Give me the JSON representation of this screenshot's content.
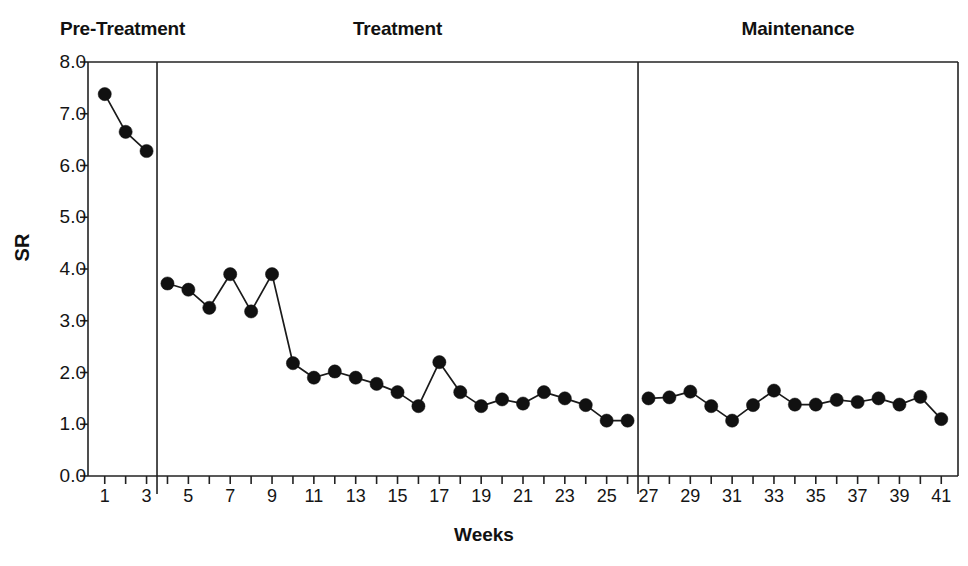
{
  "chart_data": {
    "type": "line",
    "title": "",
    "xlabel": "Weeks",
    "ylabel": "SR",
    "xlim": [
      0.2,
      41.8
    ],
    "ylim": [
      0.0,
      8.0
    ],
    "grid": false,
    "legend": null,
    "marker": "filled-circle",
    "series": [
      {
        "name": "SR",
        "x": [
          1,
          2,
          3,
          4,
          5,
          6,
          7,
          8,
          9,
          10,
          11,
          12,
          13,
          14,
          15,
          16,
          17,
          18,
          19,
          20,
          21,
          22,
          23,
          24,
          25,
          26,
          27,
          28,
          29,
          30,
          31,
          32,
          33,
          34,
          35,
          36,
          37,
          38,
          39,
          40,
          41
        ],
        "values": [
          7.38,
          6.65,
          6.28,
          3.72,
          3.6,
          3.25,
          3.9,
          3.18,
          3.9,
          2.18,
          1.9,
          2.02,
          1.9,
          1.78,
          1.62,
          1.35,
          2.2,
          1.62,
          1.35,
          1.48,
          1.4,
          1.62,
          1.5,
          1.37,
          1.07,
          1.07,
          1.5,
          1.52,
          1.63,
          1.35,
          1.07,
          1.37,
          1.65,
          1.38,
          1.38,
          1.47,
          1.43,
          1.5,
          1.38,
          1.53,
          1.1
        ]
      }
    ],
    "y_ticks": [
      0.0,
      1.0,
      2.0,
      3.0,
      4.0,
      5.0,
      6.0,
      7.0,
      8.0
    ],
    "y_tick_labels": [
      "0.0",
      "1.0",
      "2.0",
      "3.0",
      "4.0",
      "5.0",
      "6.0",
      "7.0",
      "8.0"
    ],
    "x_ticks": [
      1,
      2,
      3,
      4,
      5,
      6,
      7,
      8,
      9,
      10,
      11,
      12,
      13,
      14,
      15,
      16,
      17,
      18,
      19,
      20,
      21,
      22,
      23,
      24,
      25,
      26,
      27,
      28,
      29,
      30,
      31,
      32,
      33,
      34,
      35,
      36,
      37,
      38,
      39,
      40,
      41
    ],
    "x_labeled_ticks": [
      1,
      3,
      5,
      7,
      9,
      11,
      13,
      15,
      17,
      19,
      21,
      23,
      25,
      27,
      29,
      31,
      33,
      35,
      37,
      39,
      41
    ],
    "phases": [
      {
        "name": "Pre-Treatment",
        "label": "Pre-Treatment",
        "start_week": 1,
        "end_week": 3
      },
      {
        "name": "Treatment",
        "label": "Treatment",
        "start_week": 4,
        "end_week": 26
      },
      {
        "name": "Maintenance",
        "label": "Maintenance",
        "start_week": 27,
        "end_week": 41
      }
    ],
    "phase_dividers": [
      3.5,
      26.5
    ],
    "colors": {
      "line": "#1a1a1a",
      "marker": "#111111",
      "axis": "#222222",
      "text": "#141414",
      "background": "#ffffff"
    }
  },
  "axes": {
    "x_title": "Weeks",
    "y_title": "SR"
  }
}
